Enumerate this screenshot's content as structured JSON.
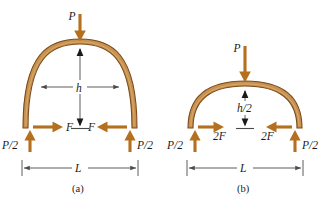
{
  "figure": {
    "background_color": "#ffffff",
    "arch_fill_color": "#c8924e",
    "arch_edge_color": "#7a4a1c",
    "force_arrow_color": "#b5701f",
    "dimension_line_color": "#4a4a4a"
  },
  "panels": [
    {
      "id": "a",
      "caption": "(a)",
      "load_label": "P",
      "height_label": "h",
      "span_label": "L",
      "horizontal_force_left_label": "F",
      "horizontal_force_right_label": "F",
      "reaction_left_label": "P/2",
      "reaction_right_label": "P/2"
    },
    {
      "id": "b",
      "caption": "(b)",
      "load_label": "P",
      "height_label": "h/2",
      "span_label": "L",
      "horizontal_force_left_label": "2F",
      "horizontal_force_right_label": "2F",
      "reaction_left_label": "P/2",
      "reaction_right_label": "P/2"
    }
  ]
}
